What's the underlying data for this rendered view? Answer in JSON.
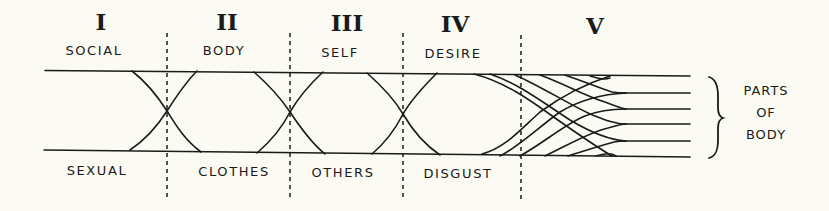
{
  "sections": [
    {
      "numeral": "I",
      "top_label": "SOCIAL",
      "bottom_label": "SEXUAL"
    },
    {
      "numeral": "II",
      "top_label": "BODY",
      "bottom_label": "CLOTHES"
    },
    {
      "numeral": "III",
      "top_label": "SELF",
      "bottom_label": "OTHERS"
    },
    {
      "numeral": "IV",
      "top_label": "DESIRE",
      "bottom_label": "DISGUST"
    },
    {
      "numeral": "V",
      "top_label": "",
      "bottom_label": ""
    }
  ],
  "bracket_label": {
    "line1": "PARTS",
    "line2": "OF",
    "line3": "BODY"
  },
  "colors": {
    "background": "#fbfbf4",
    "ink": "#1a1a1a"
  }
}
